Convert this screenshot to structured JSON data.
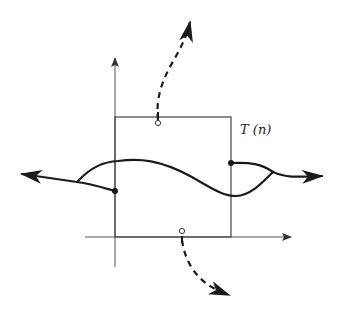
{
  "diagram": {
    "label": "T (n)",
    "colors": {
      "ink": "#1a1a1a",
      "axis": "#555555",
      "box": "#444444",
      "background": "#ffffff"
    },
    "elements": {
      "axes": [
        "x-axis",
        "y-axis"
      ],
      "box": "square region T(n)",
      "solid_curve": "trajectory through region with branches left and right",
      "dashed_curves": [
        "upward dashed escape arrow from top edge",
        "downward dashed escape arrow from bottom edge"
      ],
      "boundary_points": {
        "filled": [
          "left edge point",
          "right edge point"
        ],
        "open": [
          "top edge point",
          "bottom edge point"
        ]
      }
    }
  }
}
